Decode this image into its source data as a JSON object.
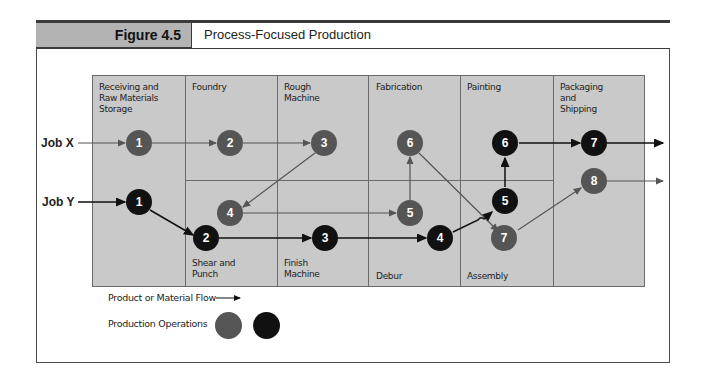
{
  "figure": {
    "number_label": "Figure 4.5",
    "title": "Process-Focused Production"
  },
  "departments": [
    {
      "id": "receiving",
      "label": "Receiving and\nRaw Materials\nStorage"
    },
    {
      "id": "foundry",
      "label": "Foundry"
    },
    {
      "id": "rough-machine",
      "label": "Rough\nMachine"
    },
    {
      "id": "fabrication",
      "label": "Fabrication"
    },
    {
      "id": "painting",
      "label": "Painting"
    },
    {
      "id": "packaging",
      "label": "Packaging\nand\nShipping"
    },
    {
      "id": "shear-punch",
      "label": "Shear and\nPunch"
    },
    {
      "id": "finish-machine",
      "label": "Finish\nMachine"
    },
    {
      "id": "debur",
      "label": "Debur"
    },
    {
      "id": "assembly",
      "label": "Assembly"
    }
  ],
  "jobs": {
    "x": {
      "label": "Job X",
      "color": "#555555"
    },
    "y": {
      "label": "Job Y",
      "color": "#111111"
    }
  },
  "nodes": {
    "x1": "1",
    "x2": "2",
    "x3": "3",
    "x4": "4",
    "x5": "5",
    "x6": "6",
    "x7": "7",
    "x8": "8",
    "y1": "1",
    "y2": "2",
    "y3": "3",
    "y4": "4",
    "y5": "5",
    "y6": "6",
    "y7": "7"
  },
  "flows": {
    "job_x": [
      "Receiving (1)",
      "Foundry (2)",
      "Rough Machine (3)",
      "Shear and Punch (4)",
      "Debur (5)",
      "Fabrication (6)",
      "Assembly (7)",
      "Packaging and Shipping (8)"
    ],
    "job_y": [
      "Receiving (1)",
      "Shear and Punch (2)",
      "Finish Machine (3)",
      "Debur (4)",
      "Assembly (5)",
      "Painting (6)",
      "Packaging and Shipping (7)"
    ]
  },
  "legend": {
    "flow_label": "Product or Material Flow",
    "operations_label": "Production Operations",
    "colors": [
      "#555555",
      "#111111"
    ]
  },
  "colors": {
    "grid_fill": "#c9c9c9",
    "header_fill": "#b3b3b3",
    "gray_node": "#555555",
    "black_node": "#111111"
  }
}
